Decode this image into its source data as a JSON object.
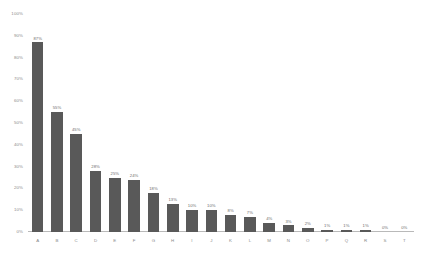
{
  "chart_data": {
    "type": "bar",
    "title": "",
    "subtitle": "",
    "xlabel": "",
    "ylabel": "",
    "categories": [
      "A",
      "B",
      "C",
      "D",
      "E",
      "F",
      "G",
      "H",
      "I",
      "J",
      "K",
      "L",
      "M",
      "N",
      "O",
      "P",
      "Q",
      "R",
      "S",
      "T"
    ],
    "values": [
      87,
      55,
      45,
      28,
      25,
      24,
      18,
      13,
      10,
      10,
      8,
      7,
      4,
      3,
      2,
      1,
      1,
      1,
      0,
      0
    ],
    "value_labels": [
      "87%",
      "55%",
      "45%",
      "28%",
      "25%",
      "24%",
      "18%",
      "13%",
      "10%",
      "10%",
      "8%",
      "7%",
      "4%",
      "3%",
      "2%",
      "1%",
      "1%",
      "1%",
      "0%",
      "0%"
    ],
    "ylim": [
      0,
      100
    ],
    "y_ticks": [
      0,
      10,
      20,
      30,
      40,
      50,
      60,
      70,
      80,
      90,
      100
    ],
    "y_tick_labels": [
      "0%",
      "10%",
      "20%",
      "30%",
      "40%",
      "50%",
      "60%",
      "70%",
      "80%",
      "90%",
      "100%"
    ],
    "grid": false,
    "legend": false,
    "legend_position": "none",
    "series": [
      {
        "name": "",
        "values": [
          87,
          55,
          45,
          28,
          25,
          24,
          18,
          13,
          10,
          10,
          8,
          7,
          4,
          3,
          2,
          1,
          1,
          1,
          0,
          0
        ]
      }
    ]
  },
  "style": {
    "bar_color": "#595959",
    "axis_color": "#b9b9b9",
    "tick_text_color": "#8a8a8a",
    "value_text_color": "#6d6d6d",
    "background_color": "#ffffff"
  }
}
